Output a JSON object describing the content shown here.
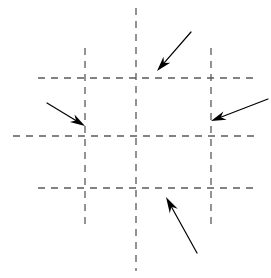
{
  "figure": {
    "name": "dashed-grid-with-inward-arrows",
    "width": 271,
    "height": 278,
    "background_color": "#ffffff"
  },
  "grid": {
    "line_color": "#5a5a5a",
    "line_width": 1.3,
    "dash_pattern": "7 6",
    "vertical_lines": [
      {
        "name": "vertical-line-left",
        "x": 85,
        "y1": 48,
        "y2": 226
      },
      {
        "name": "vertical-line-center",
        "x": 136,
        "y1": 8,
        "y2": 271
      },
      {
        "name": "vertical-line-right",
        "x": 211,
        "y1": 48,
        "y2": 226
      }
    ],
    "horizontal_lines": [
      {
        "name": "horizontal-line-top",
        "y": 78,
        "x1": 38,
        "x2": 258
      },
      {
        "name": "horizontal-line-middle",
        "y": 136,
        "x1": 13,
        "x2": 259
      },
      {
        "name": "horizontal-line-bottom",
        "y": 188,
        "x1": 38,
        "x2": 258
      }
    ]
  },
  "arrows": {
    "color": "#000000",
    "shaft_width": 1.2,
    "items": [
      {
        "name": "arrow-top",
        "label": "top arrow pointing down-left",
        "tail_x": 191,
        "tail_y": 32,
        "tip_x": 157,
        "tip_y": 71,
        "head_length": 15,
        "head_width": 9
      },
      {
        "name": "arrow-left",
        "label": "left arrow pointing down-right",
        "tail_x": 47,
        "tail_y": 103,
        "tip_x": 85,
        "tip_y": 126,
        "head_length": 15,
        "head_width": 9
      },
      {
        "name": "arrow-right",
        "label": "right arrow pointing down-left",
        "tail_x": 268,
        "tail_y": 99,
        "tip_x": 211,
        "tip_y": 121,
        "head_length": 15,
        "head_width": 9
      },
      {
        "name": "arrow-bottom",
        "label": "bottom arrow pointing up-left",
        "tail_x": 197,
        "tail_y": 253,
        "tip_x": 166,
        "tip_y": 197,
        "head_length": 16,
        "head_width": 9
      }
    ]
  }
}
